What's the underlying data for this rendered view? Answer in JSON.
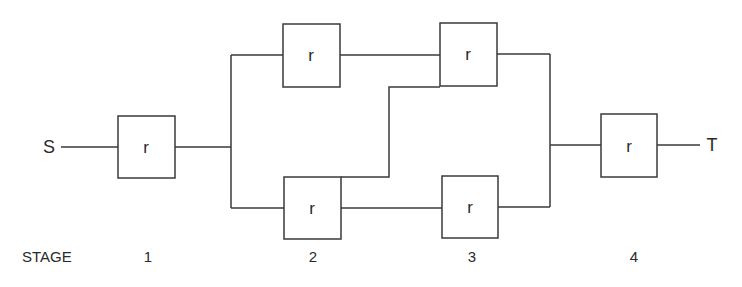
{
  "diagram": {
    "source_label": "S",
    "target_label": "T",
    "stage_label": "STAGE",
    "stages": [
      "1",
      "2",
      "3",
      "4"
    ],
    "component_label": "r",
    "colors": {
      "line": "#3a3a3a",
      "text": "#2a2a2a",
      "background": "#ffffff"
    }
  }
}
